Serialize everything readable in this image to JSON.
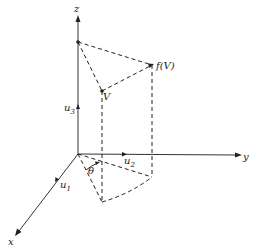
{
  "diagram": {
    "type": "3d-vector-rotation",
    "axes": {
      "z": {
        "label": "z",
        "unit_label": "u",
        "unit_sub": "3"
      },
      "y": {
        "label": "y",
        "unit_label": "u",
        "unit_sub": "2"
      },
      "x": {
        "label": "x",
        "unit_label": "u",
        "unit_sub": "1"
      }
    },
    "points": {
      "v": {
        "label": "V"
      },
      "fv": {
        "label": "f(V)"
      }
    },
    "angle": {
      "label": "θ"
    },
    "colors": {
      "stroke": "#222222",
      "background": "#ffffff"
    }
  }
}
